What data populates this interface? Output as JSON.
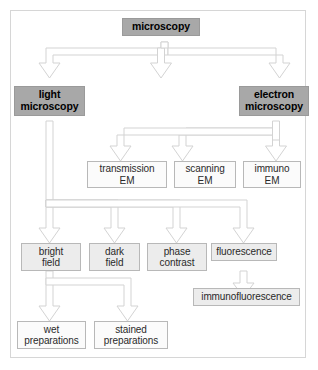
{
  "diagram": {
    "colors": {
      "dark_node_fill": "#a8a8a8",
      "light_node_fill": "#ececec",
      "plain_node_fill": "#fbfbfb",
      "node_border": "#b8b8b8",
      "arrow_fill": "#ffffff",
      "arrow_stroke": "#d0d0d0",
      "frame_border": "#d6d6d6",
      "page_background": "#ffffff",
      "text": "#2a2a2a"
    },
    "nodes": [
      {
        "id": "microscopy",
        "label": "microscopy",
        "lines": [
          "microscopy"
        ],
        "style": "dark",
        "level": 0
      },
      {
        "id": "light-microscopy",
        "label": "light microscopy",
        "lines": [
          "light",
          "microscopy"
        ],
        "style": "dark",
        "level": 1
      },
      {
        "id": "electron-microscopy",
        "label": "electron microscopy",
        "lines": [
          "electron",
          "microscopy"
        ],
        "style": "dark",
        "level": 1
      },
      {
        "id": "transmission-em",
        "label": "transmission EM",
        "lines": [
          "transmission",
          "EM"
        ],
        "style": "plain",
        "level": 2
      },
      {
        "id": "scanning-em",
        "label": "scanning EM",
        "lines": [
          "scanning",
          "EM"
        ],
        "style": "plain",
        "level": 2
      },
      {
        "id": "immuno-em",
        "label": "immuno EM",
        "lines": [
          "immuno",
          "EM"
        ],
        "style": "plain",
        "level": 2
      },
      {
        "id": "bright-field",
        "label": "bright field",
        "lines": [
          "bright",
          "field"
        ],
        "style": "light",
        "level": 3
      },
      {
        "id": "dark-field",
        "label": "dark field",
        "lines": [
          "dark",
          "field"
        ],
        "style": "light",
        "level": 3
      },
      {
        "id": "phase-contrast",
        "label": "phase contrast",
        "lines": [
          "phase",
          "contrast"
        ],
        "style": "light",
        "level": 3
      },
      {
        "id": "fluorescence",
        "label": "fluorescence",
        "lines": [
          "fluorescence"
        ],
        "style": "light",
        "level": 3
      },
      {
        "id": "immunofluorescence",
        "label": "immunofluorescence",
        "lines": [
          "immunofluorescence"
        ],
        "style": "light",
        "level": 4
      },
      {
        "id": "wet-preparations",
        "label": "wet preparations",
        "lines": [
          "wet",
          "preparations"
        ],
        "style": "plain",
        "level": 4
      },
      {
        "id": "stained-preparations",
        "label": "stained preparations",
        "lines": [
          "stained",
          "preparations"
        ],
        "style": "plain",
        "level": 4
      }
    ],
    "edges": [
      {
        "from": "microscopy",
        "to": "light-microscopy"
      },
      {
        "from": "microscopy",
        "to": "electron-microscopy"
      },
      {
        "from": "microscopy",
        "to": "phase-contrast"
      },
      {
        "from": "electron-microscopy",
        "to": "transmission-em"
      },
      {
        "from": "electron-microscopy",
        "to": "scanning-em"
      },
      {
        "from": "electron-microscopy",
        "to": "immuno-em"
      },
      {
        "from": "light-microscopy",
        "to": "bright-field"
      },
      {
        "from": "light-microscopy",
        "to": "dark-field"
      },
      {
        "from": "light-microscopy",
        "to": "phase-contrast"
      },
      {
        "from": "light-microscopy",
        "to": "fluorescence"
      },
      {
        "from": "fluorescence",
        "to": "immunofluorescence"
      },
      {
        "from": "bright-field",
        "to": "wet-preparations"
      },
      {
        "from": "bright-field",
        "to": "stained-preparations"
      }
    ]
  }
}
